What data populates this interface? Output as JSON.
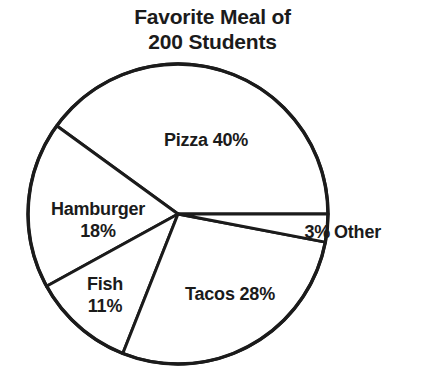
{
  "chart_data": {
    "type": "pie",
    "title": "Favorite Meal of 200 Students",
    "title_lines": [
      "Favorite Meal of",
      "200 Students"
    ],
    "total_students": 200,
    "unit": "%",
    "categories": [
      "Pizza",
      "Hamburger",
      "Fish",
      "Tacos",
      "Other"
    ],
    "values": [
      40,
      18,
      11,
      28,
      3
    ],
    "slices": [
      {
        "label": "Pizza",
        "value": 40,
        "value_text": "40%",
        "label_text": "Pizza 40%",
        "label_lines": [
          "Pizza 40%"
        ],
        "start_angle": 0,
        "end_angle": 144,
        "color": "#ffffff"
      },
      {
        "label": "Hamburger",
        "value": 18,
        "value_text": "18%",
        "label_text": "Hamburger 18%",
        "label_lines": [
          "Hamburger",
          "18%"
        ],
        "start_angle": 144,
        "end_angle": 208.8,
        "color": "#ffffff"
      },
      {
        "label": "Fish",
        "value": 11,
        "value_text": "11%",
        "label_text": "Fish 11%",
        "label_lines": [
          "Fish",
          "11%"
        ],
        "start_angle": 208.8,
        "end_angle": 248.4,
        "color": "#ffffff"
      },
      {
        "label": "Tacos",
        "value": 28,
        "value_text": "28%",
        "label_text": "Tacos 28%",
        "label_lines": [
          "Tacos 28%"
        ],
        "start_angle": 248.4,
        "end_angle": 349.2,
        "color": "#ffffff"
      },
      {
        "label": "Other",
        "value": 3,
        "value_text": "3%",
        "label_text": "Other 3%",
        "label_lines": [
          "3%",
          "Other"
        ],
        "start_angle": 349.2,
        "end_angle": 360,
        "color": "#ffffff"
      }
    ],
    "legend": null,
    "legend_position": "none",
    "grid": false,
    "labels_inside": true,
    "stroke_color": "#1b1b1b",
    "background_color": "#ffffff",
    "geometry": {
      "cx": 178,
      "cy": 214,
      "r": 150
    }
  },
  "title": {
    "line1": "Favorite Meal of",
    "line2": "200 Students"
  },
  "labels": {
    "pizza": "Pizza 40%",
    "hamburger_name": "Hamburger",
    "hamburger_pct": "18%",
    "fish_name": "Fish",
    "fish_pct": "11%",
    "tacos": "Tacos 28%",
    "other_pct": "3%",
    "other_name": "Other"
  }
}
